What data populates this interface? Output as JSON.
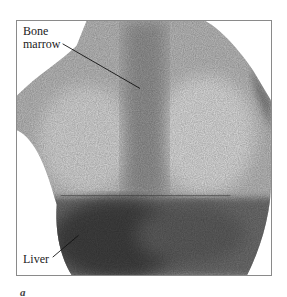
{
  "figure": {
    "letter": "a",
    "labels": {
      "bone_marrow_line1": "Bone",
      "bone_marrow_line2": "marrow",
      "liver": "Liver"
    }
  }
}
